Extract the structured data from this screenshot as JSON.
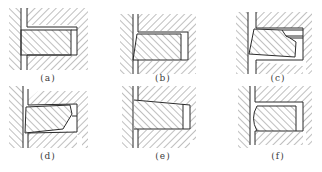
{
  "figure": {
    "line_color": "#2b2b2b",
    "hatch_color": "#6e6e6e",
    "background": "#ffffff",
    "panels": [
      {
        "id": "a",
        "label": "(a)",
        "profile": "rectangular ring"
      },
      {
        "id": "b",
        "label": "(b)",
        "profile": "taper-faced ring"
      },
      {
        "id": "c",
        "label": "(c)",
        "profile": "keystone ring with inner step"
      },
      {
        "id": "d",
        "label": "(d)",
        "profile": "keystone ring with inner bevel"
      },
      {
        "id": "e",
        "label": "(e)",
        "profile": "single-side keystone ring"
      },
      {
        "id": "f",
        "label": "(f)",
        "profile": "barrel-faced ring"
      }
    ]
  }
}
